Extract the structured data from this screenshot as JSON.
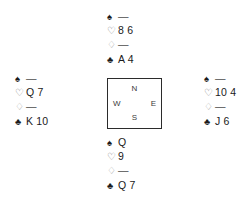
{
  "diagram": {
    "type": "bridge-hand-diagram",
    "void_symbol": "—",
    "suits": [
      {
        "key": "spades",
        "symbol": "♠",
        "name": "spade-symbol"
      },
      {
        "key": "hearts",
        "symbol": "♡",
        "name": "heart-symbol"
      },
      {
        "key": "diamonds",
        "symbol": "♢",
        "name": "diamond-symbol"
      },
      {
        "key": "clubs",
        "symbol": "♣",
        "name": "club-symbol"
      }
    ],
    "compass": {
      "north": "N",
      "west": "W",
      "east": "E",
      "south": "S"
    },
    "hands": {
      "north": {
        "position": "North",
        "spades": "—",
        "hearts": "8 6",
        "diamonds": "—",
        "clubs": "A 4"
      },
      "west": {
        "position": "West",
        "spades": "—",
        "hearts": "Q 7",
        "diamonds": "—",
        "clubs": "K 10"
      },
      "east": {
        "position": "East",
        "spades": "—",
        "hearts": "10 4",
        "diamonds": "—",
        "clubs": "J 6"
      },
      "south": {
        "position": "South",
        "spades": "Q",
        "hearts": "9",
        "diamonds": "—",
        "clubs": "Q 7"
      }
    }
  },
  "colors": {
    "ink": "#1a1a1a",
    "heart_glyph": "#6e6e6e",
    "diamond_glyph": "#a8a8a8",
    "box_border": "#2b2b2b",
    "background": "#ffffff"
  }
}
